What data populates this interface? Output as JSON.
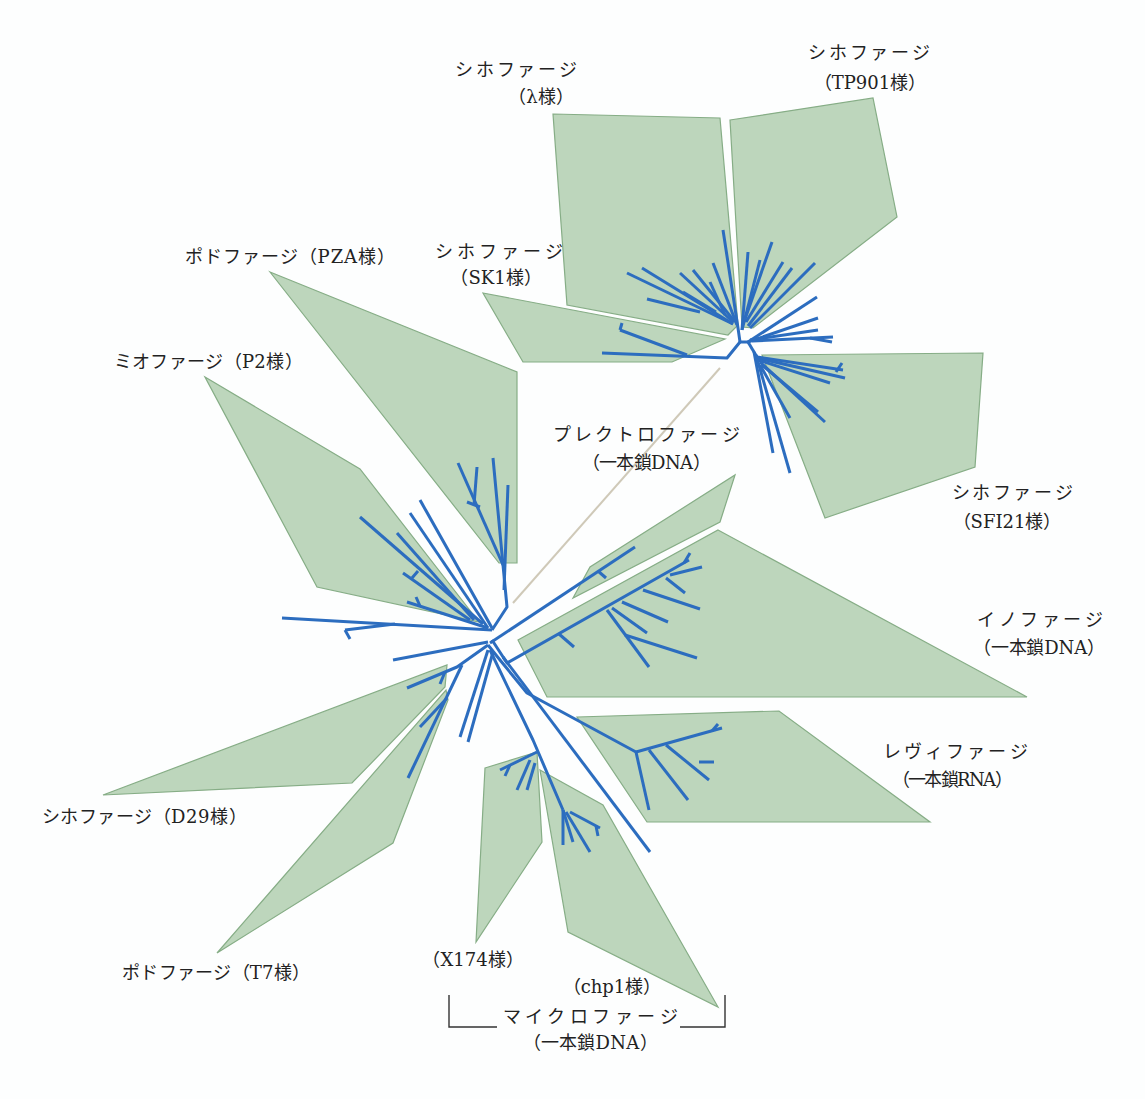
{
  "diagram": {
    "type": "unrooted-phylogenetic-tree",
    "colors": {
      "clade_fill": "#bdd6bc",
      "clade_stroke": "#86ad86",
      "branch": "#2c6dbf",
      "long_branch": "#cfc9b8",
      "text": "#222222"
    },
    "clades": [
      {
        "key": "lambda",
        "polygon": [
          [
            553,
            114
          ],
          [
            720,
            118
          ],
          [
            738,
            325
          ],
          [
            728,
            335
          ],
          [
            567,
            305
          ]
        ]
      },
      {
        "key": "tp901",
        "polygon": [
          [
            730,
            120
          ],
          [
            873,
            98
          ],
          [
            897,
            217
          ],
          [
            753,
            328
          ],
          [
            742,
            327
          ]
        ]
      },
      {
        "key": "sk1",
        "polygon": [
          [
            483,
            293
          ],
          [
            725,
            339
          ],
          [
            672,
            362
          ],
          [
            523,
            362
          ]
        ]
      },
      {
        "key": "pza",
        "polygon": [
          [
            270,
            272
          ],
          [
            517,
            372
          ],
          [
            517,
            563
          ],
          [
            499,
            563
          ]
        ]
      },
      {
        "key": "p2",
        "polygon": [
          [
            205,
            377
          ],
          [
            360,
            469
          ],
          [
            479,
            622
          ],
          [
            317,
            587
          ]
        ]
      },
      {
        "key": "sfi21",
        "polygon": [
          [
            762,
            355
          ],
          [
            983,
            353
          ],
          [
            975,
            467
          ],
          [
            825,
            518
          ]
        ]
      },
      {
        "key": "plectro",
        "polygon": [
          [
            735,
            475
          ],
          [
            720,
            522
          ],
          [
            573,
            598
          ],
          [
            590,
            567
          ]
        ]
      },
      {
        "key": "ino",
        "polygon": [
          [
            718,
            530
          ],
          [
            1027,
            697
          ],
          [
            547,
            697
          ],
          [
            518,
            640
          ]
        ]
      },
      {
        "key": "levi",
        "polygon": [
          [
            577,
            717
          ],
          [
            779,
            711
          ],
          [
            930,
            822
          ],
          [
            647,
            822
          ]
        ]
      },
      {
        "key": "d29",
        "polygon": [
          [
            447,
            665
          ],
          [
            445,
            687
          ],
          [
            352,
            783
          ],
          [
            103,
            795
          ]
        ]
      },
      {
        "key": "t7",
        "polygon": [
          [
            446,
            690
          ],
          [
            448,
            700
          ],
          [
            393,
            843
          ],
          [
            217,
            953
          ]
        ]
      },
      {
        "key": "x174",
        "polygon": [
          [
            485,
            768
          ],
          [
            537,
            752
          ],
          [
            542,
            842
          ],
          [
            476,
            942
          ]
        ]
      },
      {
        "key": "chp1",
        "polygon": [
          [
            540,
            770
          ],
          [
            603,
            805
          ],
          [
            718,
            1007
          ],
          [
            568,
            932
          ]
        ]
      }
    ],
    "long_branch": [
      513,
      603,
      720,
      368
    ],
    "branches": [
      [
        282,
        618,
        492,
        630
      ],
      [
        345,
        630,
        395,
        624
      ],
      [
        345,
        630,
        350,
        639
      ],
      [
        492,
        630,
        507,
        607,
        503,
        565,
        493,
        458
      ],
      [
        503,
        565,
        458,
        463
      ],
      [
        474,
        505,
        477,
        467
      ],
      [
        467,
        502,
        480,
        507
      ],
      [
        504,
        590,
        508,
        485
      ],
      [
        492,
        628,
        420,
        500
      ],
      [
        488,
        628,
        410,
        513
      ],
      [
        483,
        624,
        360,
        517
      ],
      [
        474,
        620,
        397,
        533
      ],
      [
        488,
        628,
        407,
        602
      ],
      [
        420,
        606,
        416,
        597
      ],
      [
        470,
        620,
        403,
        573
      ],
      [
        412,
        578,
        418,
        571
      ],
      [
        488,
        642,
        393,
        660
      ],
      [
        488,
        645,
        457,
        667,
        407,
        688
      ],
      [
        445,
        672,
        440,
        684
      ],
      [
        462,
        665,
        408,
        778
      ],
      [
        447,
        698,
        420,
        727
      ],
      [
        488,
        650,
        460,
        737
      ],
      [
        493,
        652,
        468,
        742
      ],
      [
        488,
        645,
        500,
        660,
        527,
        693,
        636,
        752
      ],
      [
        636,
        752,
        722,
        728
      ],
      [
        712,
        731,
        718,
        724
      ],
      [
        636,
        752,
        649,
        810
      ],
      [
        649,
        750,
        688,
        800
      ],
      [
        666,
        745,
        709,
        780
      ],
      [
        699,
        762,
        714,
        762
      ],
      [
        503,
        657,
        650,
        852
      ],
      [
        490,
        650,
        533,
        740,
        563,
        810
      ],
      [
        537,
        752,
        500,
        770
      ],
      [
        530,
        760,
        517,
        790
      ],
      [
        535,
        763,
        527,
        790
      ],
      [
        510,
        765,
        505,
        776
      ],
      [
        563,
        810,
        563,
        845
      ],
      [
        563,
        810,
        573,
        842
      ],
      [
        566,
        812,
        590,
        852
      ],
      [
        570,
        812,
        600,
        828
      ],
      [
        596,
        826,
        598,
        836
      ],
      [
        492,
        640,
        507,
        663,
        689,
        560
      ],
      [
        684,
        563,
        690,
        553
      ],
      [
        670,
        575,
        702,
        567
      ],
      [
        666,
        578,
        685,
        593
      ],
      [
        643,
        590,
        700,
        609
      ],
      [
        622,
        602,
        668,
        622
      ],
      [
        612,
        608,
        647,
        633
      ],
      [
        607,
        610,
        649,
        667
      ],
      [
        625,
        635,
        697,
        658
      ],
      [
        559,
        634,
        574,
        647
      ],
      [
        490,
        643,
        635,
        547
      ],
      [
        598,
        571,
        606,
        578
      ],
      [
        740,
        342,
        748,
        342
      ],
      [
        740,
        342,
        738,
        328,
        723,
        230
      ],
      [
        737,
        325,
        713,
        263
      ],
      [
        735,
        322,
        693,
        270
      ],
      [
        733,
        322,
        680,
        273
      ],
      [
        733,
        324,
        642,
        268
      ],
      [
        733,
        324,
        627,
        273
      ],
      [
        700,
        312,
        647,
        299
      ],
      [
        716,
        312,
        683,
        292
      ],
      [
        725,
        315,
        710,
        282
      ],
      [
        742,
        330,
        748,
        252
      ],
      [
        742,
        330,
        760,
        260
      ],
      [
        744,
        322,
        772,
        242
      ],
      [
        746,
        322,
        783,
        262
      ],
      [
        748,
        326,
        792,
        268
      ],
      [
        750,
        328,
        815,
        263
      ],
      [
        748,
        342,
        817,
        297
      ],
      [
        748,
        342,
        818,
        318
      ],
      [
        750,
        340,
        818,
        330
      ],
      [
        752,
        341,
        833,
        337
      ],
      [
        810,
        338,
        832,
        342
      ],
      [
        748,
        342,
        757,
        357
      ],
      [
        757,
        357,
        843,
        370
      ],
      [
        836,
        372,
        842,
        363
      ],
      [
        757,
        358,
        845,
        378
      ],
      [
        758,
        360,
        830,
        383
      ],
      [
        760,
        362,
        825,
        422
      ],
      [
        762,
        365,
        818,
        412
      ],
      [
        760,
        365,
        790,
        418
      ],
      [
        754,
        352,
        773,
        453
      ],
      [
        756,
        355,
        790,
        473
      ],
      [
        740,
        342,
        727,
        358,
        602,
        353
      ],
      [
        687,
        355,
        620,
        330
      ],
      [
        620,
        330,
        622,
        323
      ]
    ]
  },
  "labels": {
    "lambda": {
      "line1": "シホファージ",
      "line2": "（λ様）"
    },
    "tp901": {
      "line1": "シホファージ",
      "line2": "（TP901様）"
    },
    "pza": {
      "line1": "ポドファージ（PZA様）"
    },
    "sk1": {
      "line1": "シホファージ",
      "line2": "（SK1様）"
    },
    "p2": {
      "line1": "ミオファージ（P2様）"
    },
    "plectro": {
      "line1": "プレクトロファージ",
      "line2": "（一本鎖DNA）"
    },
    "sfi21": {
      "line1": "シホファージ",
      "line2": "（SFI21様）"
    },
    "ino": {
      "line1": "イノファージ",
      "line2": "（一本鎖DNA）"
    },
    "levi": {
      "line1": "レヴィファージ",
      "line2": "（一本鎖RNA）"
    },
    "d29": {
      "line1": "シホファージ（D29様）"
    },
    "t7": {
      "line1": "ポドファージ（T7様）"
    },
    "x174": {
      "line1": "（X174様）"
    },
    "chp1": {
      "line1": "（chp1様）"
    },
    "micro": {
      "line1": "マイクロファージ",
      "line2": "（一本鎖DNA）"
    }
  }
}
